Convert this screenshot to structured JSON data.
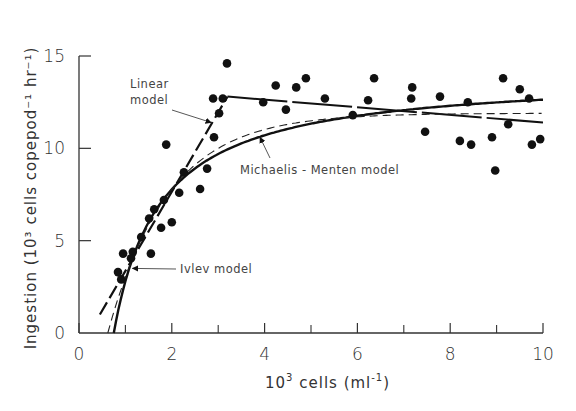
{
  "chart_data": {
    "type": "scatter",
    "title": "",
    "xlabel": "10^3 cells (ml^-1)",
    "ylabel": "Ingestion (10^3 cells copepod^-1 hr^-1)",
    "xlim": [
      0,
      10
    ],
    "ylim": [
      0,
      15
    ],
    "x_ticks": [
      0,
      2,
      4,
      6,
      8,
      10
    ],
    "x_minor_ticks": [
      1,
      3,
      5,
      7,
      9
    ],
    "y_ticks": [
      0,
      5,
      10,
      15
    ],
    "grid": false,
    "legend": "none (inline annotations)",
    "series": [
      {
        "name": "Observations",
        "type": "scatter",
        "points": [
          [
            0.84,
            3.3
          ],
          [
            0.91,
            2.9
          ],
          [
            0.95,
            4.3
          ],
          [
            1.16,
            4.4
          ],
          [
            1.12,
            4.05
          ],
          [
            1.55,
            4.3
          ],
          [
            1.34,
            5.2
          ],
          [
            1.77,
            5.7
          ],
          [
            2.0,
            6.0
          ],
          [
            1.51,
            6.2
          ],
          [
            1.62,
            6.7
          ],
          [
            1.83,
            7.2
          ],
          [
            2.16,
            7.6
          ],
          [
            2.61,
            7.8
          ],
          [
            2.26,
            8.7
          ],
          [
            2.76,
            8.9
          ],
          [
            1.88,
            10.2
          ],
          [
            2.91,
            10.6
          ],
          [
            3.02,
            11.9
          ],
          [
            2.89,
            12.7
          ],
          [
            3.1,
            12.7
          ],
          [
            3.19,
            14.6
          ],
          [
            3.97,
            12.5
          ],
          [
            4.46,
            12.1
          ],
          [
            4.24,
            13.4
          ],
          [
            4.68,
            13.3
          ],
          [
            4.89,
            13.8
          ],
          [
            5.3,
            12.7
          ],
          [
            5.9,
            11.8
          ],
          [
            6.23,
            12.6
          ],
          [
            6.36,
            13.8
          ],
          [
            7.18,
            13.3
          ],
          [
            7.16,
            12.7
          ],
          [
            7.78,
            12.8
          ],
          [
            7.46,
            10.9
          ],
          [
            8.38,
            12.5
          ],
          [
            8.21,
            10.4
          ],
          [
            8.45,
            10.2
          ],
          [
            8.9,
            10.6
          ],
          [
            8.97,
            8.8
          ],
          [
            9.14,
            13.8
          ],
          [
            9.5,
            13.2
          ],
          [
            9.7,
            12.7
          ],
          [
            9.25,
            11.3
          ],
          [
            9.76,
            10.2
          ],
          [
            9.94,
            10.5
          ]
        ]
      },
      {
        "name": "Linear model",
        "type": "line",
        "style": "thick long-dash then solid",
        "points": [
          [
            0.45,
            1.0
          ],
          [
            3.2,
            12.8
          ],
          [
            10,
            11.4
          ]
        ]
      },
      {
        "name": "Michaelis-Menten model",
        "type": "line",
        "style": "thick solid",
        "formula": "y = 14*(x-0.75)/(1.0+x-0.75)",
        "points": [
          [
            0.75,
            0
          ],
          [
            1.0,
            2.8
          ],
          [
            1.2,
            4.3
          ],
          [
            1.5,
            6.0
          ],
          [
            2.0,
            7.8
          ],
          [
            2.5,
            8.9
          ],
          [
            3.0,
            9.7
          ],
          [
            4.0,
            10.7
          ],
          [
            5.0,
            11.3
          ],
          [
            6.0,
            11.7
          ],
          [
            7.0,
            12.0
          ],
          [
            8.0,
            12.3
          ],
          [
            9.0,
            12.5
          ],
          [
            10.0,
            12.6
          ]
        ]
      },
      {
        "name": "Ivlev model",
        "type": "line",
        "style": "thin dashed",
        "formula": "y = 11.9*(1-exp(-0.77*(x-0.62)))",
        "points": [
          [
            0.62,
            0
          ],
          [
            0.8,
            1.5
          ],
          [
            1.0,
            3.0
          ],
          [
            1.2,
            4.3
          ],
          [
            1.5,
            5.8
          ],
          [
            2.0,
            7.6
          ],
          [
            2.5,
            9.0
          ],
          [
            3.0,
            10.0
          ],
          [
            4.0,
            11.0
          ],
          [
            5.0,
            11.5
          ],
          [
            6.0,
            11.7
          ],
          [
            8.0,
            11.9
          ],
          [
            10.0,
            11.9
          ]
        ]
      }
    ],
    "annotations": [
      {
        "text_line1": "Linear",
        "text_line2": "model",
        "arrow_to": [
          2.85,
          11.4
        ]
      },
      {
        "text": "Michaelis - Menten  model",
        "arrow_to": [
          3.9,
          10.6
        ]
      },
      {
        "text": "Ivlev model",
        "arrow_to": [
          1.15,
          3.5
        ]
      }
    ]
  },
  "labels": {
    "x_axis_title_base": "10",
    "x_axis_title_sup": "3",
    "x_axis_title_rest": " cells (ml",
    "x_axis_title_sup2": "-1",
    "x_axis_title_end": ")",
    "y_axis_title": "Ingestion (10³ cells copepod⁻¹ hr⁻¹)",
    "linear_line1": "Linear",
    "linear_line2": "model",
    "mm_label": "Michaelis - Menten  model",
    "ivlev_label": "Ivlev model"
  }
}
